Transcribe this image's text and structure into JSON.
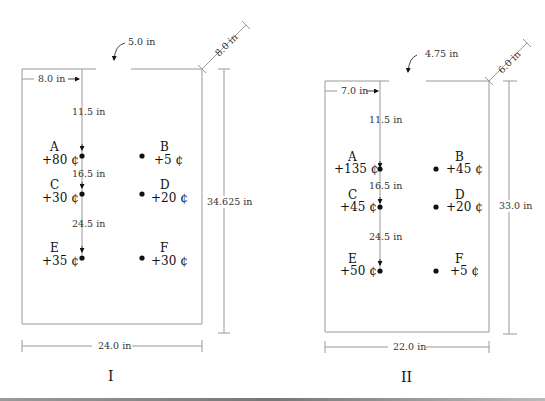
{
  "panels": [
    {
      "id": "I",
      "caption": "I",
      "door_width": "5.0 in",
      "door_offset": "8.0 in",
      "wall_depth": "8.0 in",
      "height": "34.625 in",
      "width": "24.0 in",
      "spacing": [
        "11.5 in",
        "16.5 in",
        "24.5 in"
      ],
      "spots": [
        {
          "letter": "A",
          "value": "+80 ¢"
        },
        {
          "letter": "B",
          "value": "+5 ¢"
        },
        {
          "letter": "C",
          "value": "+30 ¢"
        },
        {
          "letter": "D",
          "value": "+20 ¢"
        },
        {
          "letter": "E",
          "value": "+35 ¢"
        },
        {
          "letter": "F",
          "value": "+30 ¢"
        }
      ]
    },
    {
      "id": "II",
      "caption": "II",
      "door_width": "4.75 in",
      "door_offset": "7.0 in",
      "wall_depth": "6.0 in",
      "height": "33.0 in",
      "width": "22.0 in",
      "spacing": [
        "11.5 in",
        "16.5 in",
        "24.5 in"
      ],
      "spots": [
        {
          "letter": "A",
          "value": "+135 ¢"
        },
        {
          "letter": "B",
          "value": "+45 ¢"
        },
        {
          "letter": "C",
          "value": "+45 ¢"
        },
        {
          "letter": "D",
          "value": "+20 ¢"
        },
        {
          "letter": "E",
          "value": "+50 ¢"
        },
        {
          "letter": "F",
          "value": "+5 ¢"
        }
      ]
    }
  ]
}
